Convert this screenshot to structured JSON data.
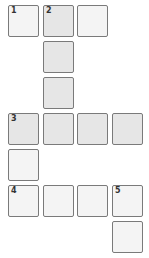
{
  "puzzle": {
    "title": "Crossword grid",
    "highlight_color": "#e6e6e6",
    "cell_color": "#f4f4f4",
    "border_color": "#7a7a7a",
    "cells": [
      {
        "row": 0,
        "col": 0,
        "number": "1",
        "highlighted": false
      },
      {
        "row": 0,
        "col": 1,
        "number": "2",
        "highlighted": true
      },
      {
        "row": 0,
        "col": 2,
        "number": "",
        "highlighted": false
      },
      {
        "row": 1,
        "col": 1,
        "number": "",
        "highlighted": true
      },
      {
        "row": 2,
        "col": 1,
        "number": "",
        "highlighted": true
      },
      {
        "row": 3,
        "col": 0,
        "number": "3",
        "highlighted": true
      },
      {
        "row": 3,
        "col": 1,
        "number": "",
        "highlighted": true
      },
      {
        "row": 3,
        "col": 2,
        "number": "",
        "highlighted": true
      },
      {
        "row": 3,
        "col": 3,
        "number": "",
        "highlighted": true
      },
      {
        "row": 4,
        "col": 0,
        "number": "",
        "highlighted": false
      },
      {
        "row": 5,
        "col": 0,
        "number": "4",
        "highlighted": false
      },
      {
        "row": 5,
        "col": 1,
        "number": "",
        "highlighted": false
      },
      {
        "row": 5,
        "col": 2,
        "number": "",
        "highlighted": false
      },
      {
        "row": 5,
        "col": 3,
        "number": "5",
        "highlighted": false
      },
      {
        "row": 6,
        "col": 3,
        "number": "",
        "highlighted": false
      }
    ]
  }
}
